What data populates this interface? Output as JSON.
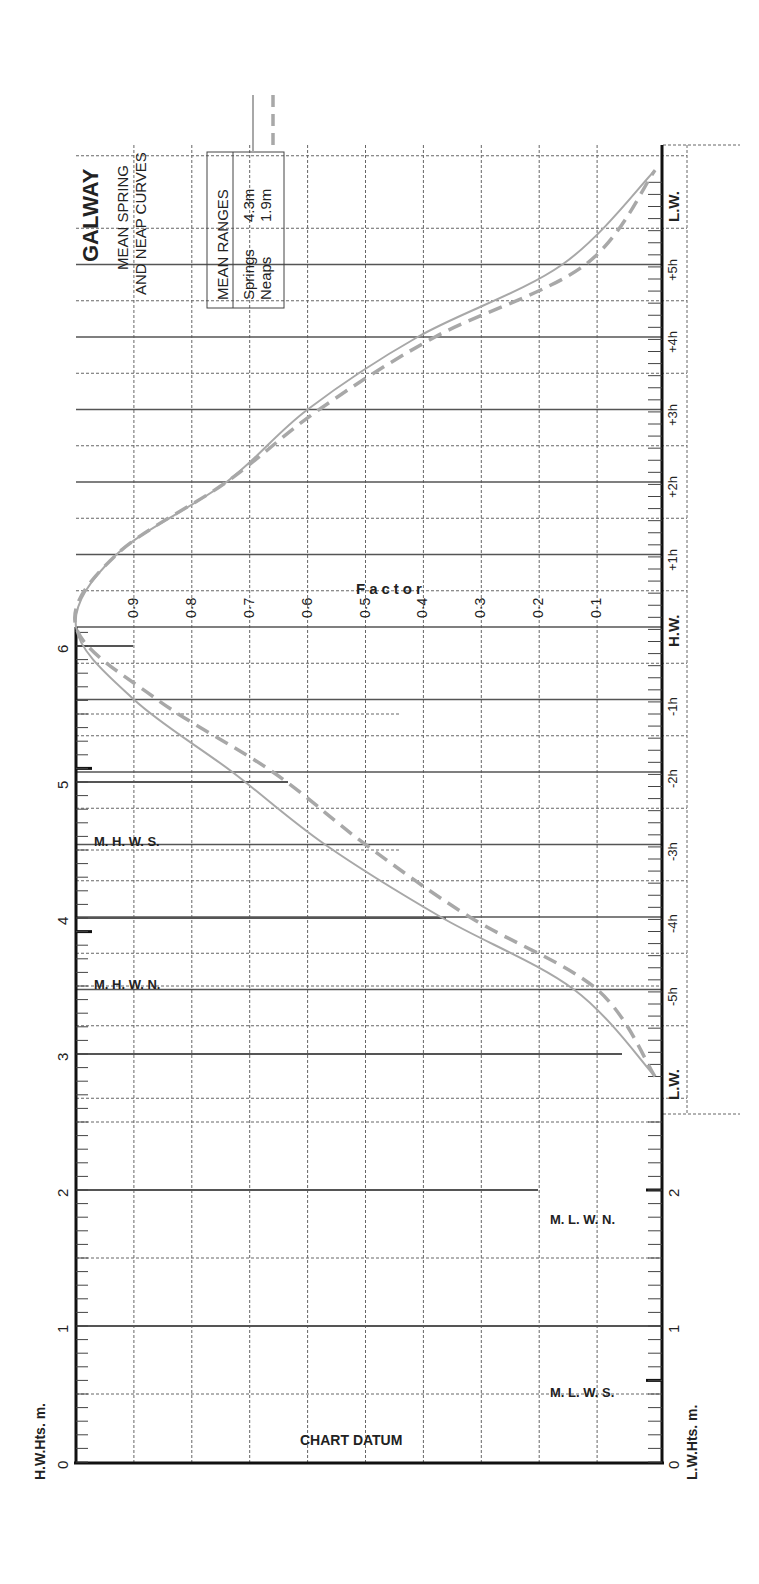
{
  "title": "GALWAY",
  "subtitle_line1": "MEAN SPRING",
  "subtitle_line2": "AND NEAP CURVES",
  "legend": {
    "header": "MEAN RANGES",
    "rows": [
      {
        "label": "Springs",
        "value": "4.3m",
        "style": "solid"
      },
      {
        "label": "Neaps",
        "value": "1.9m",
        "style": "dashed"
      }
    ]
  },
  "factor_label": "Factor",
  "factor_ticks": [
    "0·9",
    "0·8",
    "0·7",
    "0·6",
    "0·5",
    "0·4",
    "0·3",
    "0·2",
    "0·1"
  ],
  "time_ticks": [
    "L.W.",
    "+5h",
    "+4h",
    "+3h",
    "+2h",
    "+1h",
    "H.W.",
    "-1h",
    "-2h",
    "-3h",
    "-4h",
    "-5h",
    "L.W."
  ],
  "hw_axis": {
    "label": "H.W.Hts. m.",
    "ticks": [
      "0",
      "1",
      "2",
      "3",
      "4",
      "5",
      "6"
    ]
  },
  "lw_axis": {
    "label": "L.W.Hts. m.",
    "ticks": [
      "0",
      "1",
      "2"
    ]
  },
  "markers": {
    "mhws": "M. H. W. S.",
    "mhwn": "M. H. W. N.",
    "mlwn": "M. L. W. N.",
    "mlws": "M. L. W. S."
  },
  "chart_datum": "CHART DATUM",
  "colors": {
    "curve": "#a8a8a8",
    "grid": "#555555",
    "axis": "#111111"
  },
  "chart_data": {
    "type": "line",
    "xlabel": "Time relative to H.W. (hours)",
    "ylabel": "Factor",
    "x": [
      -6.2,
      -5,
      -4,
      -3,
      -2,
      -1,
      0,
      1,
      2,
      3,
      4,
      5,
      6.3
    ],
    "series": [
      {
        "name": "Springs (mean range 4.3m)",
        "style": "solid",
        "values": [
          0.0,
          0.14,
          0.37,
          0.57,
          0.73,
          0.9,
          1.0,
          0.93,
          0.74,
          0.6,
          0.41,
          0.16,
          0.0
        ]
      },
      {
        "name": "Neaps (mean range 1.9m)",
        "style": "dashed",
        "values": [
          0.0,
          0.1,
          0.32,
          0.5,
          0.66,
          0.86,
          1.0,
          0.93,
          0.74,
          0.58,
          0.38,
          0.12,
          0.0
        ]
      }
    ],
    "ylim": [
      0,
      1
    ],
    "factor_ticks": [
      0.1,
      0.2,
      0.3,
      0.4,
      0.5,
      0.6,
      0.7,
      0.8,
      0.9
    ],
    "height_scale": {
      "hw_heights_m": [
        0,
        1,
        2,
        3,
        4,
        5,
        6
      ],
      "lw_heights_m": [
        0,
        1,
        2
      ],
      "MHWS": 5.1,
      "MHWN": 3.9,
      "MLWN": 2.0,
      "MLWS": 0.6
    },
    "orientation": "rotated 90° counter-clockwise",
    "grid": true
  }
}
